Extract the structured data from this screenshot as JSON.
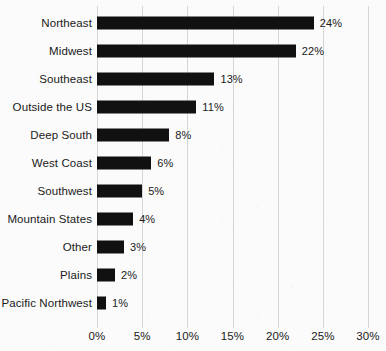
{
  "chart_data": {
    "type": "bar",
    "orientation": "horizontal",
    "title": "",
    "subtitle": "",
    "xlabel": "",
    "ylabel": "",
    "categories": [
      "Northeast",
      "Midwest",
      "Southeast",
      "Outside the US",
      "Deep South",
      "West Coast",
      "Southwest",
      "Mountain States",
      "Other",
      "Plains",
      "Pacific Northwest"
    ],
    "values": [
      24,
      22,
      13,
      11,
      8,
      6,
      5,
      4,
      3,
      2,
      1
    ],
    "data_labels": [
      "24%",
      "22%",
      "13%",
      "11%",
      "8%",
      "6%",
      "5%",
      "4%",
      "3%",
      "2%",
      "1%"
    ],
    "xlim": [
      0,
      30
    ],
    "x_ticks": [
      0,
      5,
      10,
      15,
      20,
      25,
      30
    ],
    "x_tick_labels": [
      "0%",
      "5%",
      "10%",
      "15%",
      "20%",
      "25%",
      "30%"
    ],
    "grid": "vertical",
    "legend": "none",
    "bar_color": "#111111",
    "gridline_color": "#d6d6d6",
    "text_color": "#1a1a1a",
    "background_color": "#fbfbfb"
  }
}
